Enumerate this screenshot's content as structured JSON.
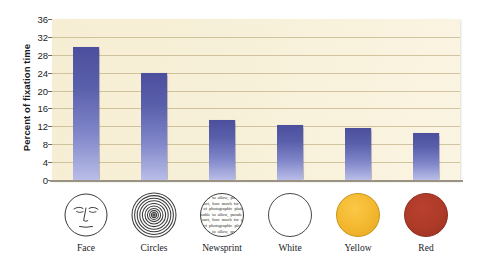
{
  "chart_data": {
    "type": "bar",
    "title": "",
    "subtitle": "",
    "xlabel": "",
    "ylabel": "Percent of fixation time",
    "categories": [
      "Face",
      "Circles",
      "Newsprint",
      "White",
      "Yellow",
      "Red"
    ],
    "values": [
      29.7,
      24.0,
      13.5,
      12.4,
      11.7,
      10.6
    ],
    "ylim": [
      0,
      36
    ],
    "yticks": [
      0,
      4,
      8,
      12,
      16,
      20,
      24,
      28,
      32,
      36
    ],
    "ytick_labels": [
      "0",
      "4",
      "8",
      "12",
      "16",
      "20",
      "24",
      "28",
      "32",
      "36"
    ],
    "grid": true,
    "legend": "none",
    "series": [
      {
        "name": "Percent of fixation time",
        "values": [
          29.7,
          24.0,
          13.5,
          12.4,
          11.7,
          10.6
        ]
      }
    ],
    "bar_gradient_top": "#4b4f9d",
    "bar_gradient_bottom": "#b9bde8",
    "plot_background": "#f7f0d8",
    "gridline_color": "#c9bb92"
  },
  "icons": [
    {
      "name": "face-icon",
      "label": "Face",
      "kind": "line-drawn-face"
    },
    {
      "name": "circles-icon",
      "label": "Circles",
      "kind": "concentric-circles"
    },
    {
      "name": "newsprint-icon",
      "label": "Newsprint",
      "kind": "text-filled-circle",
      "sample_text": "unable to allow, parade the Court, how much for pens of photographic plates"
    },
    {
      "name": "white-circle-icon",
      "label": "White",
      "kind": "solid-circle",
      "color": "#ffffff"
    },
    {
      "name": "yellow-circle-icon",
      "label": "Yellow",
      "kind": "solid-circle",
      "color": "#f3b72f"
    },
    {
      "name": "red-circle-icon",
      "label": "Red",
      "kind": "solid-circle",
      "color": "#ae3a28"
    }
  ]
}
